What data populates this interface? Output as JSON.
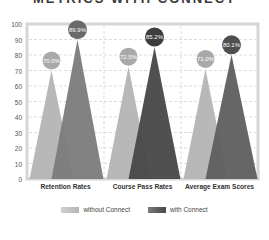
{
  "title": "METRICS WITH CONNECT",
  "chart_data": {
    "type": "bar",
    "style": "triangle-peaks",
    "title": "",
    "xlabel": "",
    "ylabel": "",
    "ylim": [
      0,
      100
    ],
    "yticks": [
      0,
      10,
      20,
      30,
      40,
      50,
      60,
      70,
      80,
      90,
      100
    ],
    "grid": true,
    "legend_position": "bottom",
    "categories": [
      "Retention Rates",
      "Course Pass Rates",
      "Average Exam Scores"
    ],
    "series": [
      {
        "name": "without Connect",
        "values": [
          70.0,
          72.5,
          71.0
        ],
        "labels": [
          "70.0%",
          "72.5%",
          "71.0%"
        ]
      },
      {
        "name": "with Connect",
        "values": [
          89.9,
          85.2,
          80.1
        ],
        "labels": [
          "89.9%",
          "85.2%",
          "80.1%"
        ]
      }
    ]
  },
  "legend": {
    "without": "without Connect",
    "with": "with Connect"
  },
  "colors": {
    "without": "#b4b4b4",
    "with": [
      "#7b7b7b",
      "#474747",
      "#5e5e5e"
    ],
    "bubble_without": "#a9a9a9",
    "bubble_with": [
      "#6a6a6a",
      "#3d3d3d",
      "#4f4f4f"
    ],
    "frame": "#d6d6d6",
    "grid": "#cfcfcf"
  }
}
